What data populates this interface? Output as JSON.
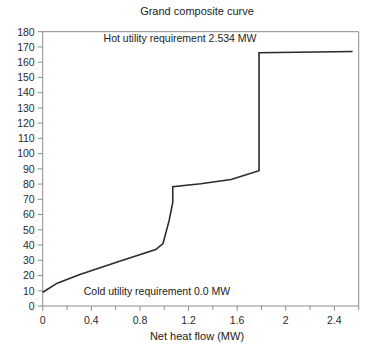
{
  "chart_data": {
    "type": "line",
    "title": "Grand composite curve",
    "xlabel": "Net heat flow (MW)",
    "ylabel": "",
    "xlim": [
      0,
      2.6
    ],
    "ylim": [
      0,
      180
    ],
    "grid": false,
    "legend": "none",
    "xticks": [
      0,
      0.4,
      0.8,
      1.2,
      1.6,
      2,
      2.4
    ],
    "xtick_labels": [
      "0",
      "0.4",
      "0.8",
      "1.2",
      "1.6",
      "2",
      "2.4"
    ],
    "xticks_minor": [
      0.2,
      0.6,
      1.0,
      1.4,
      1.8,
      2.2,
      2.6
    ],
    "yticks": [
      0,
      10,
      20,
      30,
      40,
      50,
      60,
      70,
      80,
      90,
      100,
      110,
      120,
      130,
      140,
      150,
      160,
      170,
      180
    ],
    "ytick_labels": [
      "0",
      "10",
      "20",
      "30",
      "40",
      "50",
      "60",
      "70",
      "80",
      "90",
      "100",
      "110",
      "120",
      "130",
      "140",
      "150",
      "160",
      "170",
      "180"
    ],
    "series": [
      {
        "name": "Grand composite curve",
        "color": "#2b2b2b",
        "x": [
          0.0,
          0.12,
          0.3,
          0.62,
          0.93,
          0.99,
          1.04,
          1.07,
          1.07,
          1.3,
          1.55,
          1.78,
          1.78,
          2.55
        ],
        "y": [
          9.0,
          15.0,
          20.5,
          29.0,
          37.0,
          41.0,
          56.0,
          68.0,
          78.3,
          80.2,
          83.0,
          88.8,
          166.2,
          167.0
        ]
      }
    ],
    "annotations": [
      {
        "name": "hot-utility-annotation",
        "text": "Hot utility requirement 2.534 MW",
        "x": 1.13,
        "y": 173.5,
        "anchor": "middle"
      },
      {
        "name": "cold-utility-annotation",
        "text": "Cold utility requirement 0.0 MW",
        "x": 0.94,
        "y": 7.0,
        "anchor": "middle"
      }
    ],
    "values": {
      "hot_utility_requirement_mw": 2.534,
      "cold_utility_requirement_mw": 0.0
    }
  }
}
